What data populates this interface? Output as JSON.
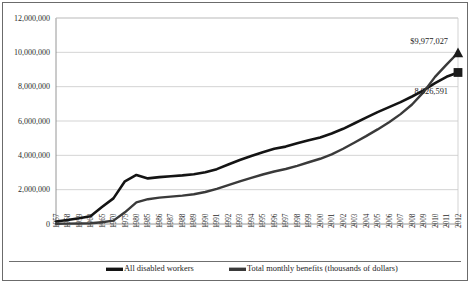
{
  "chart_data": {
    "type": "line",
    "title": "",
    "xlabel": "",
    "ylabel": "",
    "ylim": [
      0,
      12000000
    ],
    "ytick_values": [
      0,
      2000000,
      4000000,
      6000000,
      8000000,
      10000000,
      12000000
    ],
    "ytick_labels": [
      "0",
      "2,000,000",
      "4,000,000",
      "6,000,000",
      "8,000,000",
      "10,000,000",
      "12,000,000"
    ],
    "grid": true,
    "legend_position": "bottom",
    "categories": [
      "1957",
      "1958",
      "1959",
      "1960",
      "1965",
      "1970",
      "1975",
      "1980",
      "1985",
      "1986",
      "1987",
      "1988",
      "1989",
      "1990",
      "1991",
      "1992",
      "1993",
      "1994",
      "1995",
      "1996",
      "1997",
      "1998",
      "1999",
      "2000",
      "2001",
      "2002",
      "2003",
      "2004",
      "2005",
      "2006",
      "2007",
      "2008",
      "2009",
      "2010",
      "2011",
      "2012"
    ],
    "series": [
      {
        "name": "All disabled workers",
        "color": "#141414",
        "marker": "square",
        "end_label": "8,826,591",
        "values": [
          149850,
          237506,
          334443,
          455371,
          988074,
          1492948,
          2488774,
          2858680,
          2656638,
          2728463,
          2785859,
          2830284,
          2895364,
          3011294,
          3194938,
          3467783,
          3725966,
          3962954,
          4185263,
          4385623,
          4508134,
          4698319,
          4879455,
          5042333,
          5274183,
          5543981,
          5868541,
          6197385,
          6519001,
          6806918,
          7098723,
          7427203,
          7788013,
          8203951,
          8575544,
          8826591
        ]
      },
      {
        "name": "Total monthly benefits (thousands of dollars)",
        "color": "#3a3a3a",
        "marker": "triangle",
        "end_label": "$9,977,027",
        "values": [
          10900,
          19200,
          28700,
          48000,
          105000,
          196000,
          680000,
          1260000,
          1444000,
          1533000,
          1597000,
          1655000,
          1734000,
          1864000,
          2051000,
          2260000,
          2479000,
          2688000,
          2884000,
          3060000,
          3204000,
          3389000,
          3596000,
          3800000,
          4060000,
          4382000,
          4750000,
          5120000,
          5510000,
          5930000,
          6400000,
          6960000,
          7680000,
          8570000,
          9280000,
          9977027
        ]
      }
    ],
    "annotations": [
      {
        "text": "$9,977,027",
        "series": "Total monthly benefits (thousands of dollars)",
        "at_category": "2012"
      },
      {
        "text": "8,826,591",
        "series": "All disabled workers",
        "at_category": "2012"
      }
    ]
  }
}
